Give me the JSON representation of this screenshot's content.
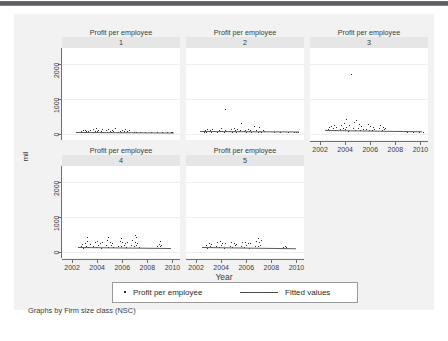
{
  "figure": {
    "ylabel": "mil",
    "xlabel": "Year",
    "note": "Graphs by Firm size class (NSC)",
    "background": "#f2f2f2",
    "panel_bg": "#ffffff",
    "strip_bg": "#e6e6e6",
    "point_color": "#2b2b2b",
    "line_color": "#5c5c5c"
  },
  "legend": {
    "marker_label": "Profit per employee",
    "line_label": "Fitted values"
  },
  "chart_data": {
    "type": "scatter",
    "title": "Profit per employee",
    "xlabel": "Year",
    "ylabel": "mil",
    "xlim": [
      2001.2,
      2010.6
    ],
    "ylim": [
      -180,
      2450
    ],
    "xticks": [
      2002,
      2004,
      2006,
      2008,
      2010
    ],
    "yticks": [
      0,
      1000,
      2000
    ],
    "xticklabels": [
      "2002",
      "2004",
      "2006",
      "2008",
      "2010"
    ],
    "yticklabels": [
      "0",
      "1000",
      "2000"
    ],
    "grid": true,
    "legend_position": "bottom",
    "facet_by": "Firm size class (NSC)",
    "facet_note": "Graphs by Firm size class (NSC)",
    "panels": [
      {
        "id": 1,
        "title": "Profit per employee",
        "label": "1",
        "row": 0,
        "col": 0,
        "show_xaxis": false,
        "show_yaxis": true,
        "fit_line": {
          "x": [
            2002.3,
            2010.1
          ],
          "y": [
            55,
            40
          ]
        },
        "points": {
          "x": [
            2002.6,
            2002.7,
            2002.8,
            2002.9,
            2003.0,
            2003.05,
            2003.1,
            2003.2,
            2003.3,
            2003.4,
            2003.6,
            2003.7,
            2003.8,
            2003.9,
            2004.0,
            2004.1,
            2004.2,
            2004.3,
            2004.4,
            2004.5,
            2004.7,
            2004.8,
            2004.9,
            2005.0,
            2005.1,
            2005.2,
            2005.3,
            2005.4,
            2005.7,
            2005.8,
            2005.9,
            2006.0,
            2006.1,
            2006.2,
            2006.3,
            2006.4,
            2006.5,
            2006.9,
            2007.1,
            2007.4,
            2007.8,
            2008.3,
            2008.8,
            2009.2,
            2009.6,
            2009.9,
            2010.0
          ],
          "y": [
            40,
            70,
            55,
            95,
            120,
            60,
            85,
            45,
            75,
            110,
            50,
            130,
            90,
            160,
            70,
            115,
            45,
            85,
            140,
            60,
            95,
            55,
            125,
            75,
            40,
            105,
            65,
            150,
            60,
            90,
            45,
            110,
            70,
            130,
            55,
            85,
            100,
            50,
            60,
            45,
            55,
            40,
            50,
            45,
            42,
            48,
            44
          ]
        }
      },
      {
        "id": 2,
        "title": "Profit per employee",
        "label": "2",
        "row": 0,
        "col": 1,
        "show_xaxis": false,
        "show_yaxis": false,
        "fit_line": {
          "x": [
            2002.3,
            2010.2
          ],
          "y": [
            70,
            55
          ]
        },
        "points": {
          "x": [
            2002.6,
            2002.7,
            2002.8,
            2002.9,
            2003.0,
            2003.1,
            2003.2,
            2003.3,
            2003.4,
            2003.7,
            2003.8,
            2003.9,
            2004.0,
            2004.1,
            2004.2,
            2004.3,
            2004.4,
            2004.7,
            2004.8,
            2004.9,
            2005.0,
            2005.1,
            2005.2,
            2005.3,
            2005.4,
            2005.5,
            2005.8,
            2005.9,
            2006.0,
            2006.1,
            2006.2,
            2006.3,
            2006.4,
            2006.8,
            2006.9,
            2007.0,
            2007.1,
            2007.2,
            2007.3,
            2007.4,
            2008.2,
            2008.7,
            2009.3,
            2009.8,
            2010.0,
            2010.1,
            2004.3,
            2005.6,
            2006.6
          ],
          "y": [
            60,
            95,
            45,
            130,
            75,
            110,
            55,
            140,
            85,
            50,
            120,
            70,
            155,
            90,
            45,
            105,
            65,
            80,
            140,
            55,
            175,
            95,
            60,
            125,
            70,
            100,
            65,
            110,
            50,
            135,
            75,
            95,
            55,
            120,
            60,
            185,
            85,
            45,
            100,
            70,
            50,
            55,
            45,
            50,
            48,
            52,
            700,
            310,
            230
          ]
        }
      },
      {
        "id": 3,
        "title": "Profit per employee",
        "label": "3",
        "row": 0,
        "col": 2,
        "show_xaxis": true,
        "show_yaxis": false,
        "fit_line": {
          "x": [
            2002.4,
            2010.1
          ],
          "y": [
            105,
            70
          ]
        },
        "points": {
          "x": [
            2002.6,
            2002.7,
            2002.8,
            2002.9,
            2003.0,
            2003.1,
            2003.2,
            2003.3,
            2003.6,
            2003.7,
            2003.8,
            2003.9,
            2004.0,
            2004.1,
            2004.2,
            2004.3,
            2004.6,
            2004.7,
            2004.8,
            2004.9,
            2005.0,
            2005.1,
            2005.2,
            2005.3,
            2005.4,
            2005.7,
            2005.8,
            2005.9,
            2006.0,
            2006.1,
            2006.2,
            2006.3,
            2006.7,
            2006.8,
            2006.9,
            2007.0,
            2007.1,
            2007.2,
            2008.3,
            2008.9,
            2009.4,
            2009.9,
            2010.2,
            2004.5,
            2004.1
          ],
          "y": [
            130,
            180,
            95,
            215,
            150,
            240,
            110,
            190,
            125,
            260,
            160,
            310,
            135,
            205,
            90,
            245,
            175,
            330,
            120,
            395,
            155,
            265,
            105,
            210,
            145,
            140,
            280,
            115,
            225,
            95,
            185,
            130,
            160,
            250,
            110,
            195,
            135,
            170,
            70,
            60,
            55,
            50,
            48,
            1700,
            430
          ]
        }
      },
      {
        "id": 4,
        "title": "Profit per employee",
        "label": "4",
        "row": 1,
        "col": 0,
        "show_xaxis": true,
        "show_yaxis": true,
        "fit_line": {
          "x": [
            2002.5,
            2009.9
          ],
          "y": [
            145,
            120
          ]
        },
        "points": {
          "x": [
            2002.7,
            2002.8,
            2002.9,
            2003.0,
            2003.1,
            2003.2,
            2003.3,
            2003.4,
            2003.7,
            2003.8,
            2003.9,
            2004.0,
            2004.1,
            2004.2,
            2004.3,
            2004.4,
            2004.7,
            2004.8,
            2004.9,
            2005.0,
            2005.1,
            2005.2,
            2005.3,
            2005.7,
            2005.8,
            2005.9,
            2006.0,
            2006.1,
            2006.2,
            2006.3,
            2006.4,
            2006.7,
            2006.8,
            2006.9,
            2007.0,
            2007.1,
            2007.2,
            2007.3,
            2008.8,
            2008.9,
            2009.0,
            2009.1,
            2003.2,
            2004.9,
            2005.9,
            2007.0,
            2007.1,
            2009.0
          ],
          "y": [
            150,
            210,
            120,
            260,
            175,
            300,
            135,
            230,
            165,
            280,
            140,
            320,
            190,
            250,
            115,
            290,
            180,
            340,
            145,
            270,
            200,
            235,
            125,
            170,
            310,
            150,
            285,
            195,
            240,
            130,
            265,
            185,
            330,
            160,
            275,
            205,
            245,
            140,
            155,
            230,
            175,
            195,
            430,
            420,
            400,
            470,
            410,
            300
          ]
        }
      },
      {
        "id": 5,
        "title": "Profit per employee",
        "label": "5",
        "row": 1,
        "col": 1,
        "show_xaxis": true,
        "show_yaxis": false,
        "fit_line": {
          "x": [
            2002.5,
            2010.0
          ],
          "y": [
            130,
            95
          ]
        },
        "points": {
          "x": [
            2002.7,
            2002.8,
            2002.9,
            2003.0,
            2003.1,
            2003.2,
            2003.3,
            2003.6,
            2003.7,
            2003.8,
            2003.9,
            2004.0,
            2004.1,
            2004.2,
            2004.3,
            2004.7,
            2004.8,
            2004.9,
            2005.0,
            2005.1,
            2005.2,
            2005.6,
            2005.7,
            2005.8,
            2005.9,
            2006.0,
            2006.1,
            2006.2,
            2006.3,
            2006.7,
            2006.8,
            2006.9,
            2007.0,
            2007.1,
            2008.8,
            2008.9,
            2009.0,
            2009.1,
            2009.2,
            2006.9,
            2007.2
          ],
          "y": [
            140,
            200,
            115,
            250,
            165,
            225,
            130,
            155,
            270,
            135,
            300,
            180,
            240,
            110,
            260,
            170,
            290,
            145,
            255,
            190,
            220,
            160,
            280,
            125,
            265,
            185,
            235,
            120,
            250,
            175,
            300,
            150,
            270,
            195,
            115,
            140,
            105,
            160,
            125,
            380,
            330
          ]
        }
      }
    ]
  }
}
